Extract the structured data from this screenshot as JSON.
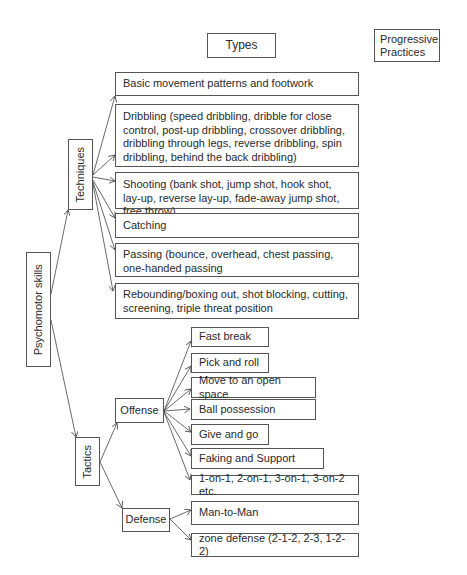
{
  "header": {
    "types_label": "Types",
    "progressive_label_line1": "Progressive",
    "progressive_label_line2": "Practices"
  },
  "root": {
    "label": "Psychomotor skills"
  },
  "techniques": {
    "label": "Techniques",
    "items": [
      "Basic movement patterns and footwork",
      "Dribbling (speed dribbling, dribble for close control, post-up dribbling, crossover dribbling, dribbling through legs, reverse dribbling, spin  dribbling, behind the back dribbling)",
      "Shooting (bank shot, jump shot, hook shot, lay-up, reverse lay-up, fade-away jump shot, free throw)",
      "Catching",
      "Passing (bounce, overhead, chest passing, one-handed passing",
      "Rebounding/boxing out, shot blocking, cutting, screening, triple threat position"
    ]
  },
  "tactics": {
    "label": "Tactics",
    "offense": {
      "label": "Offense",
      "items": [
        "Fast break",
        "Pick and roll",
        "Move to an open space",
        "Ball possession",
        "Give and go",
        "Faking and Support",
        "1-on-1, 2-on-1, 3-on-1, 3-on-2 etc."
      ]
    },
    "defense": {
      "label": "Defense",
      "items": [
        "Man-to-Man",
        "zone defense (2-1-2, 2-3, 1-2-2)"
      ]
    }
  }
}
